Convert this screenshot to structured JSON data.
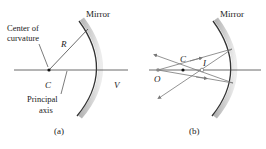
{
  "panels": [
    {
      "id": "a",
      "caption": "(a)",
      "labels": {
        "mirror": "Mirror",
        "center_line1": "Center of",
        "center_line2": "curvature",
        "radius": "R",
        "center_point": "C",
        "vertex": "V",
        "axis_line1": "Principal",
        "axis_line2": "axis"
      }
    },
    {
      "id": "b",
      "caption": "(b)",
      "labels": {
        "mirror": "Mirror",
        "center_point": "C",
        "object": "O",
        "image": "I"
      }
    }
  ],
  "colors": {
    "line": "#333333",
    "mirror_shadow": "#b0b0b0",
    "ray": "#777777"
  }
}
